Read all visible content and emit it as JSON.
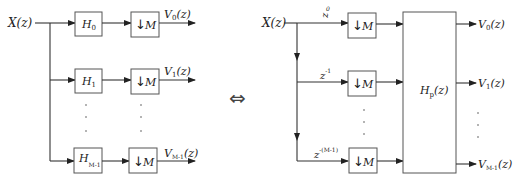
{
  "left_diagram": {
    "input_label": "X(z)",
    "filters": [
      {
        "name": "H",
        "sub": "0"
      },
      {
        "name": "H",
        "sub": "1"
      },
      {
        "name": "H",
        "sub": "M-1"
      }
    ],
    "decimator": {
      "arrow": "↓",
      "factor": "M"
    },
    "outputs": [
      {
        "name": "V",
        "sub": "0",
        "arg": "(z)"
      },
      {
        "name": "V",
        "sub": "1",
        "arg": "(z)"
      },
      {
        "name": "V",
        "sub": "M-1",
        "arg": "(z)"
      }
    ],
    "ellipsis": "⋮"
  },
  "equivalence_symbol": "⇔",
  "right_diagram": {
    "input_label": "X(z)",
    "delays": [
      {
        "base": "z",
        "exp": "0"
      },
      {
        "base": "z",
        "exp": "-1"
      },
      {
        "base": "z",
        "exp": "-(M-1)"
      }
    ],
    "decimator": {
      "arrow": "↓",
      "factor": "M"
    },
    "polyphase_matrix": {
      "name": "H",
      "sub": "p",
      "arg": "(z)"
    },
    "outputs": [
      {
        "name": "V",
        "sub": "0",
        "arg": "(z)"
      },
      {
        "name": "V",
        "sub": "1",
        "arg": "(z)"
      },
      {
        "name": "V",
        "sub": "M-1",
        "arg": "(z)"
      }
    ]
  }
}
